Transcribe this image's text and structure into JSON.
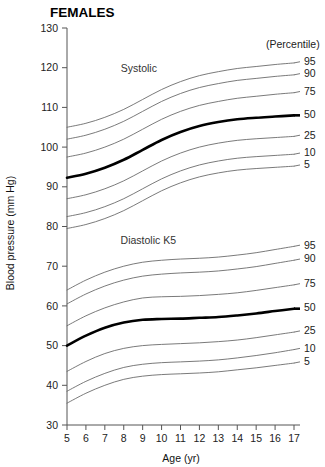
{
  "chart_data": {
    "type": "line",
    "title": "FEMALES",
    "xlabel": "Age (yr)",
    "ylabel": "Blood pressure (mm Hg)",
    "legend_header": "(Percentile)",
    "legend_position": "right",
    "grid": false,
    "xlim": [
      5,
      17
    ],
    "ylim": [
      30,
      130
    ],
    "xticks": [
      5,
      6,
      7,
      8,
      9,
      10,
      11,
      12,
      13,
      14,
      15,
      16,
      17
    ],
    "xtick_labels": [
      "5",
      "6",
      "7",
      "8",
      "9",
      "10",
      "11",
      "12",
      "13",
      "14",
      "15",
      "16",
      "17"
    ],
    "yticks": [
      30,
      40,
      50,
      60,
      70,
      80,
      90,
      100,
      110,
      120,
      130
    ],
    "ytick_labels": [
      "30",
      "40",
      "50",
      "60",
      "70",
      "80",
      "90",
      "100",
      "110",
      "120",
      "130"
    ],
    "x": [
      5,
      6,
      7,
      8,
      9,
      10,
      11,
      12,
      13,
      14,
      15,
      16,
      17
    ],
    "groups": [
      {
        "name": "Systolic",
        "annotation": "Systolic",
        "annotation_x": 8.8,
        "annotation_y": 119.0,
        "series": [
          {
            "name": "95",
            "percentile": "95",
            "emphasis": false,
            "values": [
              105.0,
              106.0,
              107.5,
              109.5,
              112.0,
              114.5,
              116.5,
              118.0,
              119.0,
              119.8,
              120.3,
              120.8,
              121.2
            ]
          },
          {
            "name": "90",
            "percentile": "90",
            "emphasis": false,
            "values": [
              102.0,
              103.0,
              104.5,
              106.5,
              109.0,
              111.5,
              113.5,
              115.0,
              116.0,
              116.8,
              117.3,
              117.8,
              118.2
            ]
          },
          {
            "name": "75",
            "percentile": "75",
            "emphasis": false,
            "values": [
              97.5,
              98.5,
              100.0,
              102.0,
              104.5,
              107.0,
              109.0,
              110.5,
              111.5,
              112.3,
              112.8,
              113.3,
              113.7
            ]
          },
          {
            "name": "50",
            "percentile": "50",
            "emphasis": true,
            "values": [
              92.3,
              93.3,
              94.8,
              96.8,
              99.3,
              101.8,
              103.8,
              105.3,
              106.3,
              107.0,
              107.4,
              107.7,
              108.0
            ]
          },
          {
            "name": "25",
            "percentile": "25",
            "emphasis": false,
            "values": [
              87.0,
              88.0,
              89.5,
              91.5,
              94.0,
              96.5,
              98.5,
              100.0,
              101.0,
              101.7,
              102.1,
              102.4,
              102.7
            ]
          },
          {
            "name": "10",
            "percentile": "10",
            "emphasis": false,
            "values": [
              82.5,
              83.5,
              85.0,
              87.0,
              89.5,
              92.0,
              94.0,
              95.5,
              96.5,
              97.2,
              97.6,
              97.9,
              98.2
            ]
          },
          {
            "name": "5",
            "percentile": "5",
            "emphasis": false,
            "values": [
              79.5,
              80.5,
              82.0,
              84.0,
              86.5,
              89.0,
              91.0,
              92.5,
              93.5,
              94.2,
              94.6,
              94.9,
              95.2
            ]
          }
        ]
      },
      {
        "name": "Diastolic K5",
        "annotation": "Diastolic K5",
        "annotation_x": 9.3,
        "annotation_y": 75.5,
        "series": [
          {
            "name": "95",
            "percentile": "95",
            "emphasis": false,
            "values": [
              64.0,
              66.5,
              68.5,
              70.0,
              71.0,
              71.5,
              71.8,
              72.0,
              72.3,
              72.8,
              73.4,
              74.2,
              75.0
            ]
          },
          {
            "name": "90",
            "percentile": "90",
            "emphasis": false,
            "values": [
              60.5,
              63.0,
              65.0,
              66.5,
              67.5,
              68.0,
              68.3,
              68.5,
              68.8,
              69.3,
              69.9,
              70.7,
              71.5
            ]
          },
          {
            "name": "75",
            "percentile": "75",
            "emphasis": false,
            "values": [
              55.0,
              57.5,
              59.5,
              61.0,
              62.0,
              62.3,
              62.4,
              62.6,
              62.9,
              63.3,
              63.9,
              64.6,
              65.3
            ]
          },
          {
            "name": "50",
            "percentile": "50",
            "emphasis": true,
            "values": [
              50.0,
              52.5,
              54.5,
              55.8,
              56.5,
              56.7,
              56.8,
              57.0,
              57.2,
              57.6,
              58.1,
              58.7,
              59.3
            ]
          },
          {
            "name": "25",
            "percentile": "25",
            "emphasis": false,
            "values": [
              43.5,
              46.0,
              48.0,
              49.3,
              50.0,
              50.3,
              50.5,
              50.7,
              51.0,
              51.4,
              52.0,
              52.7,
              53.4
            ]
          },
          {
            "name": "10",
            "percentile": "10",
            "emphasis": false,
            "values": [
              38.5,
              41.0,
              43.0,
              44.5,
              45.3,
              45.7,
              45.9,
              46.1,
              46.4,
              46.9,
              47.5,
              48.2,
              49.0
            ]
          },
          {
            "name": "5",
            "percentile": "5",
            "emphasis": false,
            "values": [
              35.5,
              38.0,
              40.0,
              41.5,
              42.3,
              42.7,
              42.9,
              43.1,
              43.4,
              43.9,
              44.4,
              45.0,
              45.6
            ]
          }
        ]
      }
    ]
  }
}
